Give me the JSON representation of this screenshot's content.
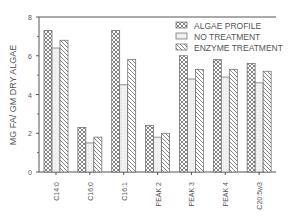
{
  "chart_data": {
    "type": "bar",
    "title": "",
    "xlabel": "",
    "ylabel": "MG FA/ GM DRY ALGAE",
    "ylim": [
      0,
      8
    ],
    "yticks": [
      0,
      2,
      4,
      6,
      8
    ],
    "grid": false,
    "legend_position": "upper right",
    "categories": [
      "C14:0",
      "C16:0",
      "C16:1",
      "PEAK 2",
      "PEAK 3",
      "PEAK 4",
      "C20:5w3"
    ],
    "series": [
      {
        "name": "ALGAE PROFILE",
        "pattern": "crosshatch",
        "values": [
          7.3,
          2.3,
          7.3,
          2.4,
          6.0,
          5.8,
          5.6
        ]
      },
      {
        "name": "NO TREATMENT",
        "pattern": "dotted-light",
        "values": [
          6.4,
          1.5,
          4.5,
          1.8,
          4.8,
          4.9,
          4.6
        ]
      },
      {
        "name": "ENZYME TREATMENT",
        "pattern": "diagonal",
        "values": [
          6.8,
          1.8,
          5.8,
          2.0,
          5.3,
          5.3,
          5.2
        ]
      }
    ]
  },
  "colors": {
    "axis": "#555555",
    "bar_stroke": "#666666",
    "text": "#555555"
  }
}
